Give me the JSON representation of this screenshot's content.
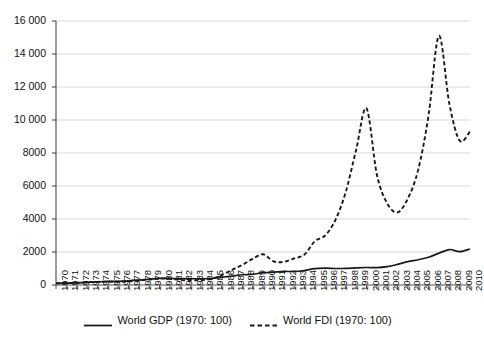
{
  "chart_data": {
    "type": "line",
    "title": "",
    "subtitle": "",
    "xlabel": "",
    "ylabel": "",
    "xlim": [
      1970,
      2010
    ],
    "ylim": [
      0,
      16000
    ],
    "grid": true,
    "legend_position": "bottom",
    "y_ticks": [
      0,
      2000,
      4000,
      6000,
      8000,
      10000,
      12000,
      14000,
      16000
    ],
    "y_tick_labels": [
      "0",
      "2000",
      "4000",
      "6000",
      "8000",
      "10 000",
      "12 000",
      "14 000",
      "16 000"
    ],
    "x": [
      1970,
      1971,
      1972,
      1973,
      1974,
      1975,
      1976,
      1977,
      1978,
      1979,
      1980,
      1981,
      1982,
      1983,
      1984,
      1985,
      1986,
      1987,
      1988,
      1989,
      1990,
      1991,
      1992,
      1993,
      1994,
      1995,
      1996,
      1997,
      1998,
      1999,
      2000,
      2001,
      2002,
      2003,
      2004,
      2005,
      2006,
      2007,
      2008,
      2009,
      2010
    ],
    "x_tick_labels": [
      "1970",
      "1971",
      "1972",
      "1973",
      "1974",
      "1975",
      "1976",
      "1977",
      "1978",
      "1979",
      "1980",
      "1981",
      "1982",
      "1983",
      "1984",
      "1985",
      "1986",
      "1987",
      "1988",
      "1989",
      "1990",
      "1991",
      "1992",
      "1993",
      "1994",
      "1995",
      "1996",
      "1997",
      "1998",
      "1999",
      "2000",
      "2001",
      "2002",
      "2003",
      "2004",
      "2005",
      "2006",
      "2007",
      "2008",
      "2009",
      "2010"
    ],
    "series": [
      {
        "name": "World GDP (1970: 100)",
        "style": "solid",
        "color": "#1a1a1a",
        "values": [
          100,
          115,
          130,
          160,
          185,
          215,
          225,
          255,
          300,
          350,
          400,
          395,
          385,
          380,
          380,
          390,
          470,
          545,
          620,
          650,
          745,
          780,
          820,
          820,
          880,
          990,
          1020,
          1000,
          1010,
          1040,
          1060,
          1050,
          1110,
          1250,
          1420,
          1530,
          1680,
          1930,
          2150,
          2020,
          2180
        ]
      },
      {
        "name": "World FDI (1970: 100)",
        "style": "dashed",
        "color": "#1a1a1a",
        "values": [
          100,
          110,
          135,
          175,
          190,
          205,
          195,
          215,
          270,
          330,
          390,
          390,
          300,
          290,
          290,
          370,
          600,
          920,
          1220,
          1580,
          1860,
          1440,
          1400,
          1610,
          1840,
          2650,
          3000,
          3950,
          5650,
          8200,
          10700,
          6700,
          4950,
          4400,
          5250,
          7000,
          10300,
          15100,
          11000,
          8750,
          9300
        ]
      }
    ]
  },
  "legend": {
    "entries": [
      {
        "label": "World GDP (1970: 100)",
        "style": "solid"
      },
      {
        "label": "World FDI (1970: 100)",
        "style": "dashed"
      }
    ]
  }
}
